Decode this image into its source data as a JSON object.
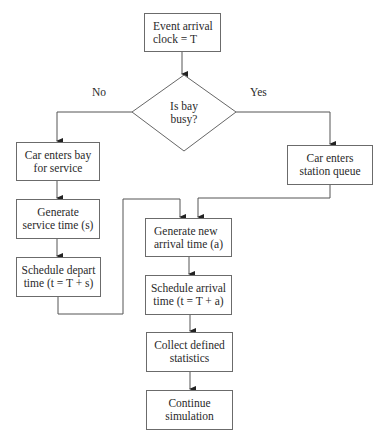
{
  "diagram": {
    "type": "flowchart",
    "nodes": {
      "start": "Event arrival\nclock = T",
      "decision": "Is bay\nbusy?",
      "enter_bay": "Car enters bay\nfor service",
      "gen_service": "Generate\nservice time (s)",
      "sched_depart": "Schedule depart\ntime (t = T + s)",
      "enter_queue": "Car enters\nstation queue",
      "gen_arrival": "Generate new\narrival time (a)",
      "sched_arrival": "Schedule arrival\ntime (t = T + a)",
      "collect": "Collect defined\nstatistics",
      "continue": "Continue\nsimulation"
    },
    "edge_labels": {
      "no": "No",
      "yes": "Yes"
    },
    "edges": [
      {
        "from": "start",
        "to": "decision"
      },
      {
        "from": "decision",
        "to": "enter_bay",
        "label": "No"
      },
      {
        "from": "decision",
        "to": "enter_queue",
        "label": "Yes"
      },
      {
        "from": "enter_bay",
        "to": "gen_service"
      },
      {
        "from": "gen_service",
        "to": "sched_depart"
      },
      {
        "from": "sched_depart",
        "to": "gen_arrival"
      },
      {
        "from": "enter_queue",
        "to": "gen_arrival"
      },
      {
        "from": "gen_arrival",
        "to": "sched_arrival"
      },
      {
        "from": "sched_arrival",
        "to": "collect"
      },
      {
        "from": "collect",
        "to": "continue"
      }
    ]
  }
}
